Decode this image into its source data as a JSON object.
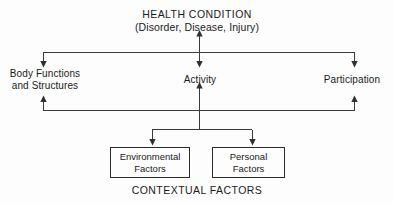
{
  "diagram": {
    "title": "HEALTH CONDITION",
    "subtitle": "(Disorder, Disease, Injury)",
    "footer": "CONTEXTUAL FACTORS",
    "nodes": {
      "body_functions": "Body Functions\nand Structures",
      "activity": "Activity",
      "participation": "Participation"
    },
    "boxes": [
      {
        "label": "Environmental\nFactors"
      },
      {
        "label": "Personal\nFactors"
      }
    ],
    "colors": {
      "background": "#fdfdfd",
      "line": "#3a3a3a",
      "box_border": "#2a2a2a",
      "text": "#1b1b1b"
    },
    "connectors": [
      {
        "name": "health-to-activity-arrow",
        "kind": "double-headed-vertical"
      },
      {
        "name": "top-bus-to-body-functions-arrow",
        "kind": "arrow-down"
      },
      {
        "name": "top-bus-to-participation-arrow",
        "kind": "arrow-down"
      },
      {
        "name": "body-functions-to-bottom-bus-arrow",
        "kind": "arrow-up"
      },
      {
        "name": "participation-to-bottom-bus-arrow",
        "kind": "arrow-up"
      },
      {
        "name": "contextual-to-activity-arrow",
        "kind": "arrow-up"
      },
      {
        "name": "fork-to-environmental-factors-arrow",
        "kind": "arrow-down"
      },
      {
        "name": "fork-to-personal-factors-arrow",
        "kind": "arrow-down"
      }
    ]
  }
}
